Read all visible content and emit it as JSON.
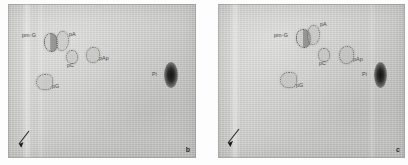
{
  "figure": {
    "type": "two-panel autoradiograph / thin-layer chromatogram",
    "width": 408,
    "height": 165,
    "background_color": "#fdfdfd",
    "plate_color": "#cdcdcb",
    "blot_color": "#131313",
    "label_color": "#4a4a48"
  },
  "panels": [
    {
      "id": "panel-b",
      "letter": "b",
      "origin_marker": "arrow-icon",
      "spots": [
        {
          "name": "pm7G",
          "label_html": "pm⁷G",
          "label": "pm7G",
          "x": 36,
          "y": 29,
          "w": 12,
          "h": 17,
          "fill": "halffill",
          "label_x": 19,
          "label_y": 28,
          "label_align": "right"
        },
        {
          "name": "pA",
          "label": "pA",
          "x": 48,
          "y": 27,
          "w": 11,
          "h": 18,
          "fill": "open",
          "label_x": 62,
          "label_y": 29,
          "label_align": "left"
        },
        {
          "name": "pC",
          "label": "pC",
          "x": 58,
          "y": 46,
          "w": 10,
          "h": 12,
          "fill": "open",
          "label_x": 60,
          "label_y": 60,
          "label_align": "left"
        },
        {
          "name": "pAp",
          "label": "pAp",
          "x": 78,
          "y": 43,
          "w": 12,
          "h": 14,
          "fill": "open",
          "label_x": 92,
          "label_y": 54,
          "label_align": "left"
        },
        {
          "name": "pG",
          "label": "pG",
          "x": 28,
          "y": 70,
          "w": 15,
          "h": 14,
          "fill": "open",
          "label_x": 45,
          "label_y": 81,
          "label_align": "left"
        },
        {
          "name": "Pi",
          "label": "Pi",
          "x": 158,
          "y": 62,
          "w": 10,
          "h": 20,
          "fill": "blot",
          "label_x": 146,
          "label_y": 70,
          "label_align": "right"
        }
      ]
    },
    {
      "id": "panel-c",
      "letter": "c",
      "origin_marker": "arrow-icon",
      "spots": [
        {
          "name": "pm7G",
          "label_html": "pm⁷G",
          "label": "pm7G",
          "x": 78,
          "y": 25,
          "w": 13,
          "h": 17,
          "fill": "halffill",
          "label_x": 61,
          "label_y": 29,
          "label_align": "right"
        },
        {
          "name": "pA",
          "label": "pA",
          "x": 89,
          "y": 21,
          "w": 11,
          "h": 18,
          "fill": "open",
          "label_x": 103,
          "label_y": 20,
          "label_align": "left"
        },
        {
          "name": "pC",
          "label": "pC",
          "x": 100,
          "y": 44,
          "w": 10,
          "h": 12,
          "fill": "open",
          "label_x": 102,
          "label_y": 58,
          "label_align": "left"
        },
        {
          "name": "pAp",
          "label": "pAp",
          "x": 121,
          "y": 42,
          "w": 13,
          "h": 16,
          "fill": "open",
          "label_x": 136,
          "label_y": 55,
          "label_align": "left"
        },
        {
          "name": "pG",
          "label": "pG",
          "x": 62,
          "y": 68,
          "w": 15,
          "h": 14,
          "fill": "open",
          "label_x": 79,
          "label_y": 80,
          "label_align": "left"
        },
        {
          "name": "Pi",
          "label": "Pi",
          "x": 158,
          "y": 62,
          "w": 9,
          "h": 19,
          "fill": "blot",
          "label_x": 146,
          "label_y": 70,
          "label_align": "right"
        }
      ]
    }
  ]
}
